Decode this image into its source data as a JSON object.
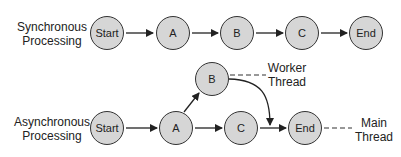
{
  "diagram": {
    "sync": {
      "label_line1": "Synchronous",
      "label_line2": "Processing",
      "nodes": [
        "Start",
        "A",
        "B",
        "C",
        "End"
      ]
    },
    "async": {
      "label_line1": "Asynchronous",
      "label_line2": "Processing",
      "nodes": {
        "start": "Start",
        "a": "A",
        "b": "B",
        "c": "C",
        "end": "End"
      },
      "worker_thread_line1": "Worker",
      "worker_thread_line2": "Thread",
      "main_thread_line1": "Main",
      "main_thread_line2": "Thread"
    },
    "colors": {
      "node_fill": "#d6d6d6",
      "stroke": "#333333"
    }
  }
}
